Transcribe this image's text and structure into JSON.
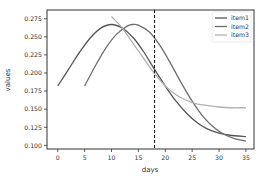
{
  "chart_data": {
    "type": "line",
    "title": "",
    "xlabel": "days",
    "ylabel": "values",
    "xlim": [
      -2,
      36.5
    ],
    "ylim": [
      0.095,
      0.287
    ],
    "xticks": [
      0,
      5,
      10,
      15,
      20,
      25,
      30,
      35
    ],
    "yticks": [
      0.1,
      0.125,
      0.15,
      0.175,
      0.2,
      0.225,
      0.25,
      0.275
    ],
    "ytick_labels": [
      "0.100",
      "0.125",
      "0.150",
      "0.175",
      "0.200",
      "0.225",
      "0.250",
      "0.275"
    ],
    "grid": false,
    "legend_position": "upper right",
    "vline": {
      "x": 18,
      "style": "dashed",
      "color": "#111111"
    },
    "series": [
      {
        "name": "item1",
        "color": "#555555",
        "x": [
          0,
          2,
          4,
          6,
          8,
          10,
          12,
          14,
          16,
          18,
          20,
          22,
          24,
          26,
          28,
          30,
          32,
          35
        ],
        "values": [
          0.182,
          0.205,
          0.228,
          0.248,
          0.262,
          0.267,
          0.262,
          0.249,
          0.229,
          0.205,
          0.182,
          0.161,
          0.144,
          0.131,
          0.122,
          0.117,
          0.114,
          0.112
        ]
      },
      {
        "name": "item2",
        "color": "#6e6e6e",
        "x": [
          5,
          7,
          9,
          11,
          13,
          14,
          15,
          17,
          19,
          21,
          23,
          25,
          27,
          29,
          31,
          33,
          35
        ],
        "values": [
          0.182,
          0.21,
          0.235,
          0.254,
          0.265,
          0.267,
          0.266,
          0.257,
          0.238,
          0.213,
          0.186,
          0.161,
          0.14,
          0.125,
          0.115,
          0.109,
          0.106
        ]
      },
      {
        "name": "item3",
        "color": "#b0b0b0",
        "x": [
          10,
          12,
          14,
          16,
          18,
          20,
          22,
          24,
          26,
          28,
          30,
          32,
          35
        ],
        "values": [
          0.278,
          0.262,
          0.241,
          0.22,
          0.199,
          0.182,
          0.17,
          0.162,
          0.157,
          0.155,
          0.153,
          0.152,
          0.152
        ]
      }
    ]
  }
}
